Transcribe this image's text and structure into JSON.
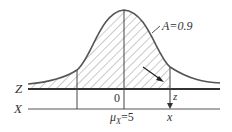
{
  "diagram": {
    "type": "normal-distribution-standardization",
    "axes": {
      "z_axis_label": "Z",
      "x_axis_label": "X"
    },
    "labels": {
      "area": "A=0.9",
      "z_origin": "0",
      "mean_prefix": "μ",
      "mean_subscript": "X",
      "mean_value": "=5",
      "z_value": "z",
      "x_value": "x"
    },
    "colors": {
      "curve": "#555555",
      "axis": "#333333",
      "hatch": "#777777",
      "text": "#333333"
    }
  }
}
